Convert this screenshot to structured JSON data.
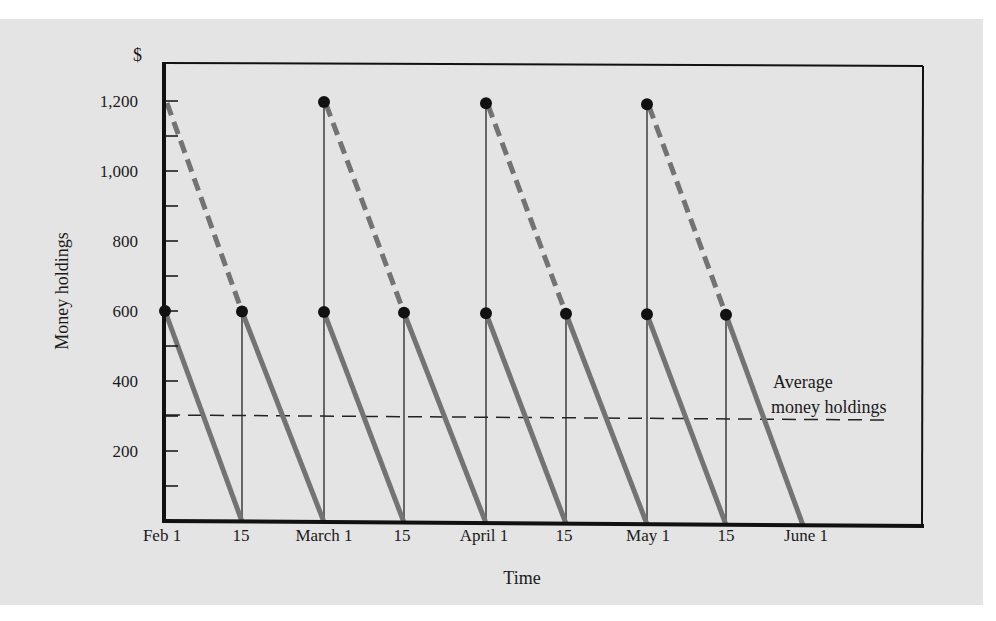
{
  "chart_data": {
    "type": "line",
    "title": "",
    "xlabel": "Time",
    "ylabel": "Money holdings",
    "y_unit_label": "$",
    "ylim": [
      0,
      1300
    ],
    "yticks": [
      200,
      400,
      600,
      800,
      1000,
      1200
    ],
    "ytick_labels": [
      "200",
      "400",
      "600",
      "800",
      "1,000",
      "1,200"
    ],
    "y_minor_tick_step": 100,
    "xticks": [
      "Feb 1",
      "15",
      "March 1",
      "15",
      "April 1",
      "15",
      "May 1",
      "15",
      "June 1"
    ],
    "grid": false,
    "series": [
      {
        "name": "Money holdings (paid twice monthly, $600 each)",
        "style": "solid thick gray sawtooth",
        "points": [
          {
            "x": "Feb 1",
            "y": 600
          },
          {
            "x": "Feb 15",
            "y": 0
          },
          {
            "x": "Feb 15",
            "y": 600
          },
          {
            "x": "March 1",
            "y": 0
          },
          {
            "x": "March 1",
            "y": 600
          },
          {
            "x": "March 15",
            "y": 0
          },
          {
            "x": "March 15",
            "y": 600
          },
          {
            "x": "April 1",
            "y": 0
          },
          {
            "x": "April 1",
            "y": 600
          },
          {
            "x": "April 15",
            "y": 0
          },
          {
            "x": "April 15",
            "y": 600
          },
          {
            "x": "May 1",
            "y": 0
          },
          {
            "x": "May 1",
            "y": 600
          },
          {
            "x": "May 15",
            "y": 0
          },
          {
            "x": "May 15",
            "y": 600
          },
          {
            "x": "June 1",
            "y": 0
          }
        ]
      },
      {
        "name": "Money holdings (paid monthly, $1,200 each)",
        "style": "dashed thick gray, from 1,200 to 600 over first half-month",
        "points": [
          {
            "x": "Feb 1",
            "y": 1200
          },
          {
            "x": "Feb 15",
            "y": 600
          },
          {
            "x": "March 1",
            "y": 1200
          },
          {
            "x": "March 15",
            "y": 600
          },
          {
            "x": "April 1",
            "y": 1200
          },
          {
            "x": "April 15",
            "y": 600
          },
          {
            "x": "May 1",
            "y": 1200
          },
          {
            "x": "May 15",
            "y": 600
          }
        ]
      },
      {
        "name": "Average money holdings",
        "style": "thin dashed black horizontal",
        "points": [
          {
            "x": "Feb 1",
            "y": 300
          },
          {
            "x": "end",
            "y": 300
          }
        ]
      }
    ],
    "markers": {
      "dots_at_600": [
        "Feb 1",
        "Feb 15",
        "March 1",
        "March 15",
        "April 1",
        "April 15",
        "May 1",
        "May 15"
      ],
      "dots_at_1200": [
        "March 1",
        "April 1",
        "May 1"
      ]
    },
    "annotations": [
      {
        "text_line1": "Average",
        "text_line2": "money holdings",
        "points_to": "Average money holdings line at $300"
      }
    ]
  },
  "labels": {
    "currency": "$",
    "ylabel": "Money holdings",
    "xlabel": "Time",
    "yticks": [
      "200",
      "400",
      "600",
      "800",
      "1,000",
      "1,200"
    ],
    "xticks": [
      "Feb 1",
      "15",
      "March 1",
      "15",
      "April 1",
      "15",
      "May 1",
      "15",
      "June 1"
    ],
    "annotation_line1": "Average",
    "annotation_line2": "money holdings"
  },
  "colors": {
    "background": "#e4e4e4",
    "sawtooth": "#737373",
    "axis": "#111111",
    "dot": "#111111"
  }
}
